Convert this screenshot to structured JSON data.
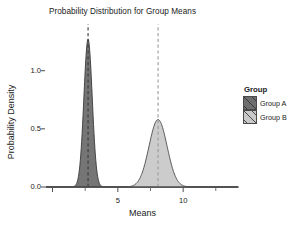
{
  "chart_data": {
    "type": "area",
    "title": "Probability Distribution for Group Means",
    "xlabel": "Means",
    "ylabel": "Probability Density",
    "xlim": [
      -0.5,
      14.2
    ],
    "ylim": [
      0.0,
      1.35
    ],
    "grid": false,
    "legend_position": "right",
    "legend_title": "Group",
    "x_ticks": [
      0,
      5,
      10
    ],
    "x_tick_labels": [
      "",
      "5",
      "10"
    ],
    "x_minor_ticks": [
      2.5,
      7.5,
      12.5
    ],
    "y_ticks": [
      0.0,
      0.5,
      1.0
    ],
    "y_tick_labels": [
      "0.0",
      "0.5",
      "1.0"
    ],
    "series": [
      {
        "name": "Group A",
        "distribution": "normal",
        "mean": 2.72,
        "sd": 0.32,
        "peak_density": 1.27,
        "fill_color": "#6e6e6e",
        "line_color": "#3a3a3a",
        "mean_line_color": "#3a3a3a",
        "mean_line_style": "dashed"
      },
      {
        "name": "Group B",
        "distribution": "normal",
        "mean": 8.08,
        "sd": 0.69,
        "peak_density": 0.58,
        "fill_color": "#c9c9c9",
        "line_color": "#4a4a4a",
        "mean_line_color": "#9a9a9a",
        "mean_line_style": "dashed"
      }
    ]
  },
  "legend": {
    "title": "Group",
    "items": [
      {
        "label": "Group A",
        "color": "#6e6e6e"
      },
      {
        "label": "Group B",
        "color": "#c9c9c9"
      }
    ]
  },
  "axes": {
    "axis_line_color": "#4d4d4d",
    "text_color": "#1a1a1a"
  }
}
